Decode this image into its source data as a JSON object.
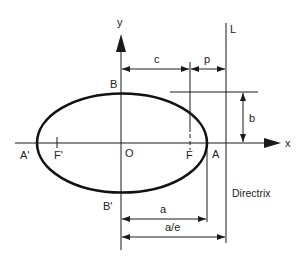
{
  "diagram": {
    "type": "ellipse-geometry",
    "colors": {
      "stroke": "#1a1a1a",
      "text": "#222222",
      "background": "#ffffff"
    },
    "axes": {
      "x_label": "x",
      "y_label": "y",
      "origin_label": "O"
    },
    "points": {
      "vertex_right": "A",
      "vertex_left": "A'",
      "focus_right": "F",
      "focus_left": "F'",
      "co_vertex_top": "B",
      "co_vertex_bottom": "B'"
    },
    "directrix": {
      "line_label": "L",
      "caption": "Directrix"
    },
    "dimensions": {
      "c": "c",
      "p": "p",
      "b": "b",
      "a": "a",
      "a_over_e": "a/e"
    }
  }
}
